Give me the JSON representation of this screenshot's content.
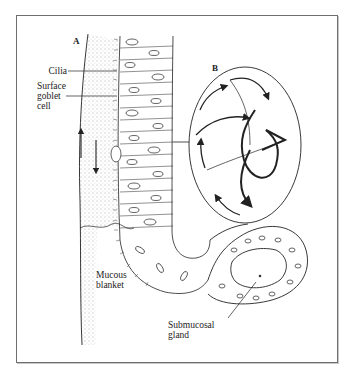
{
  "figure": {
    "panel_labels": {
      "a": "A",
      "b": "B"
    },
    "labels": {
      "cilia": "Cilia",
      "surface_goblet_cell": [
        "Surface",
        "goblet",
        "cell"
      ],
      "mucous_blanket": [
        "Mucous",
        "blanket"
      ],
      "submucosal_gland": [
        "Submucosal",
        "gland"
      ]
    },
    "colors": {
      "ink": "#222222",
      "frame": "#6f6f6f",
      "background": "#ffffff"
    }
  }
}
